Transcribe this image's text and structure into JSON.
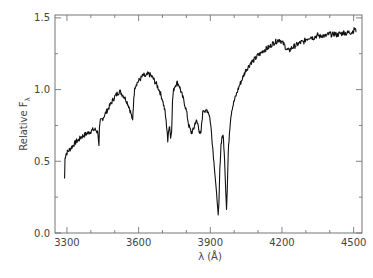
{
  "chart_data": {
    "type": "line",
    "title": "",
    "xlabel": "λ (Å)",
    "ylabel": "Relative F",
    "ylabel_subscript": "λ",
    "xlim": [
      3250,
      4535
    ],
    "ylim": [
      0.0,
      1.52
    ],
    "x_ticks": [
      3300,
      3600,
      3900,
      4200,
      4500
    ],
    "x_tick_labels": [
      "3300",
      "3600",
      "3900",
      "4200",
      "4500"
    ],
    "x_minor_step": 100,
    "y_ticks": [
      0.0,
      0.5,
      1.0,
      1.5
    ],
    "y_tick_labels": [
      "0.0",
      "0.5",
      "1.0",
      "1.5"
    ],
    "y_minor_step": 0.25,
    "grid": false,
    "legend": null,
    "line_color": "#111111",
    "series": [
      {
        "name": "spectrum",
        "x": [
          3290,
          3292,
          3295,
          3300,
          3310,
          3320,
          3330,
          3340,
          3350,
          3360,
          3370,
          3380,
          3390,
          3400,
          3410,
          3420,
          3430,
          3434,
          3436,
          3440,
          3450,
          3460,
          3470,
          3480,
          3490,
          3500,
          3510,
          3520,
          3530,
          3540,
          3550,
          3560,
          3570,
          3575,
          3580,
          3585,
          3590,
          3600,
          3610,
          3620,
          3630,
          3640,
          3650,
          3660,
          3670,
          3680,
          3690,
          3700,
          3710,
          3715,
          3720,
          3722,
          3725,
          3730,
          3734,
          3738,
          3742,
          3745,
          3750,
          3760,
          3770,
          3775,
          3780,
          3790,
          3800,
          3810,
          3820,
          3830,
          3835,
          3840,
          3845,
          3850,
          3855,
          3860,
          3865,
          3870,
          3875,
          3880,
          3885,
          3890,
          3895,
          3900,
          3905,
          3910,
          3915,
          3920,
          3925,
          3930,
          3933,
          3936,
          3940,
          3945,
          3950,
          3955,
          3960,
          3965,
          3968,
          3971,
          3975,
          3980,
          3985,
          3990,
          4000,
          4010,
          4020,
          4030,
          4040,
          4050,
          4060,
          4070,
          4080,
          4090,
          4100,
          4110,
          4120,
          4130,
          4140,
          4150,
          4160,
          4170,
          4180,
          4190,
          4200,
          4210,
          4220,
          4230,
          4240,
          4250,
          4260,
          4270,
          4280,
          4290,
          4300,
          4310,
          4320,
          4330,
          4340,
          4350,
          4360,
          4370,
          4380,
          4390,
          4400,
          4410,
          4420,
          4430,
          4440,
          4450,
          4460,
          4470,
          4480,
          4490,
          4500,
          4505,
          4510
        ],
        "y": [
          0.38,
          0.52,
          0.55,
          0.56,
          0.58,
          0.6,
          0.62,
          0.64,
          0.65,
          0.67,
          0.68,
          0.69,
          0.7,
          0.71,
          0.72,
          0.72,
          0.7,
          0.6,
          0.72,
          0.78,
          0.8,
          0.83,
          0.86,
          0.89,
          0.92,
          0.95,
          0.97,
          0.99,
          0.97,
          0.95,
          0.92,
          0.88,
          0.82,
          0.78,
          0.95,
          1.02,
          1.04,
          1.06,
          1.08,
          1.1,
          1.09,
          1.11,
          1.1,
          1.08,
          1.05,
          1.02,
          0.98,
          0.93,
          0.85,
          0.78,
          0.7,
          0.62,
          0.72,
          0.75,
          0.66,
          0.72,
          0.92,
          0.98,
          1.02,
          1.05,
          1.03,
          1.0,
          0.97,
          0.92,
          0.85,
          0.75,
          0.7,
          0.72,
          0.76,
          0.78,
          0.77,
          0.75,
          0.7,
          0.68,
          0.78,
          0.86,
          0.86,
          0.84,
          0.86,
          0.85,
          0.83,
          0.78,
          0.7,
          0.6,
          0.5,
          0.4,
          0.3,
          0.2,
          0.12,
          0.2,
          0.45,
          0.62,
          0.68,
          0.66,
          0.5,
          0.28,
          0.17,
          0.3,
          0.55,
          0.7,
          0.8,
          0.86,
          0.92,
          0.97,
          1.02,
          1.06,
          1.1,
          1.14,
          1.16,
          1.19,
          1.2,
          1.22,
          1.24,
          1.25,
          1.27,
          1.28,
          1.29,
          1.3,
          1.32,
          1.33,
          1.34,
          1.35,
          1.33,
          1.31,
          1.28,
          1.27,
          1.29,
          1.3,
          1.31,
          1.32,
          1.33,
          1.33,
          1.35,
          1.36,
          1.37,
          1.36,
          1.37,
          1.38,
          1.37,
          1.38,
          1.37,
          1.38,
          1.39,
          1.38,
          1.39,
          1.38,
          1.39,
          1.39,
          1.4,
          1.39,
          1.4,
          1.4,
          1.41,
          1.43,
          1.4
        ]
      }
    ]
  }
}
